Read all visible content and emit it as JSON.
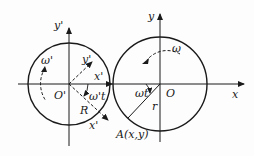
{
  "diagram": {
    "left_frame": {
      "origin_label": "O'",
      "x_axis_label": "x'",
      "y_axis_label": "y'",
      "rotating_x_label": "x'",
      "rotating_y_label": "y'",
      "rotated_x_label": "x'",
      "angle_label": "ω't",
      "radius_label": "R",
      "rotation_label": "ω'"
    },
    "right_frame": {
      "origin_label": "O",
      "x_axis_label": "x",
      "y_axis_label": "y",
      "angle_label": "ωt",
      "radius_label": "r",
      "point_label": "A(x,y)",
      "rotation_label": "ω"
    },
    "colors": {
      "stroke": "#1a1a1a",
      "background": "#fdfdfd"
    }
  }
}
